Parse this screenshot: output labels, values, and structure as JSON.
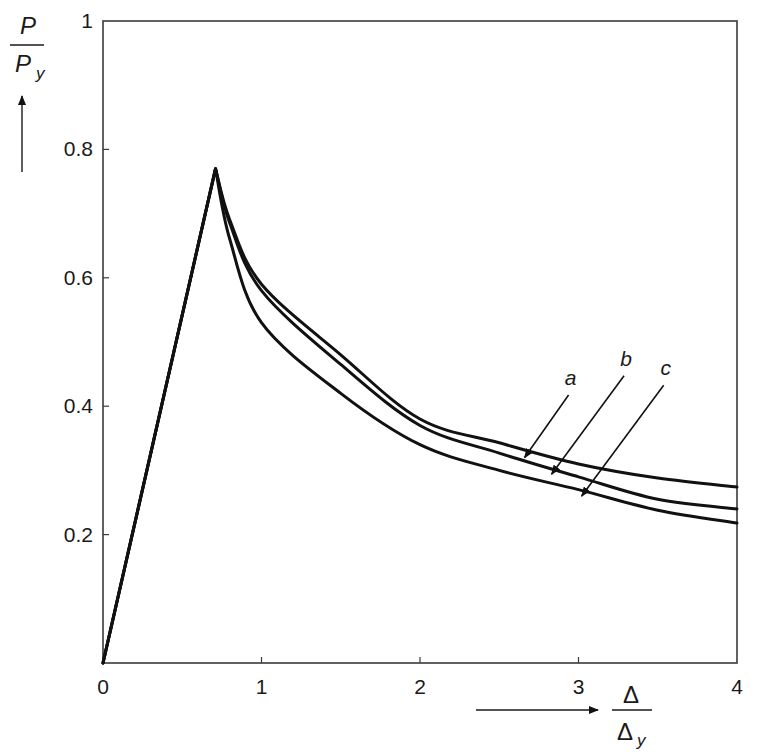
{
  "chart_data": {
    "type": "line",
    "title": "",
    "xlabel": "Δ / Δy",
    "ylabel": "P / Py",
    "xlim": [
      0,
      4
    ],
    "ylim": [
      0,
      1
    ],
    "grid": false,
    "x_ticks": [
      "0",
      "1",
      "2",
      "3",
      "4"
    ],
    "y_ticks": [
      "0.2",
      "0.4",
      "0.6",
      "0.8",
      "1"
    ],
    "x_tick_values": [
      0,
      1,
      2,
      3,
      4
    ],
    "y_tick_values": [
      0.2,
      0.4,
      0.6,
      0.8,
      1.0
    ],
    "legend_position": "inline labels with leader arrows",
    "shared_prepeak": {
      "x": [
        0,
        0.71
      ],
      "y": [
        0,
        0.77
      ]
    },
    "series": [
      {
        "name": "a",
        "x": [
          0,
          0.71,
          0.8,
          1.0,
          1.5,
          2.0,
          2.5,
          3.0,
          3.5,
          4.0
        ],
        "y": [
          0,
          0.77,
          0.69,
          0.59,
          0.48,
          0.38,
          0.343,
          0.31,
          0.288,
          0.274
        ]
      },
      {
        "name": "b",
        "x": [
          0,
          0.71,
          0.8,
          1.0,
          1.5,
          2.0,
          2.5,
          3.0,
          3.5,
          4.0
        ],
        "y": [
          0,
          0.77,
          0.685,
          0.58,
          0.465,
          0.37,
          0.327,
          0.29,
          0.255,
          0.24
        ]
      },
      {
        "name": "c",
        "x": [
          0,
          0.71,
          0.8,
          1.0,
          1.5,
          2.0,
          2.5,
          3.0,
          3.5,
          4.0
        ],
        "y": [
          0,
          0.77,
          0.66,
          0.53,
          0.42,
          0.34,
          0.3,
          0.27,
          0.238,
          0.218
        ]
      }
    ],
    "annotations": [
      {
        "text": "a",
        "label_xy": [
          2.95,
          0.43
        ],
        "arrow_to": [
          2.66,
          0.32
        ]
      },
      {
        "text": "b",
        "label_xy": [
          3.3,
          0.46
        ],
        "arrow_to": [
          2.83,
          0.294
        ]
      },
      {
        "text": "c",
        "label_xy": [
          3.55,
          0.445
        ],
        "arrow_to": [
          3.02,
          0.26
        ]
      }
    ]
  },
  "axes": {
    "y_title_num": "P",
    "y_title_den": "P",
    "y_title_den_sub": "y",
    "x_title_num": "Δ",
    "x_title_den": "Δ",
    "x_title_den_sub": "y",
    "x_ticks": [
      "0",
      "1",
      "2",
      "3",
      "4"
    ],
    "y_ticks": [
      "0.2",
      "0.4",
      "0.6",
      "0.8",
      "1"
    ]
  },
  "labels": {
    "a": "a",
    "b": "b",
    "c": "c"
  },
  "style": {
    "line_color": "#111111",
    "frame_color": "#3a3a3a",
    "background": "#ffffff"
  }
}
